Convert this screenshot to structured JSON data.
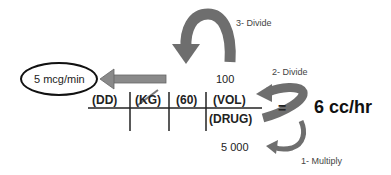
{
  "diagram": {
    "result_box": {
      "text": "5 mcg/min"
    },
    "top_value": "100",
    "bottom_value": "5 000",
    "terms": {
      "dd": "(DD)",
      "kg": "(KG)",
      "sixty": "(60)",
      "vol": "(VOL)",
      "drug": "(DRUG)"
    },
    "equals": "=",
    "given_rate": "6 cc/hr",
    "steps": [
      {
        "label": "1- Multiply"
      },
      {
        "label": "2- Divide"
      },
      {
        "label": "3- Divide"
      }
    ],
    "colors": {
      "arrow": "#6e6e6e",
      "left_arrow": "#8a8a8a",
      "line": "#222222"
    }
  }
}
